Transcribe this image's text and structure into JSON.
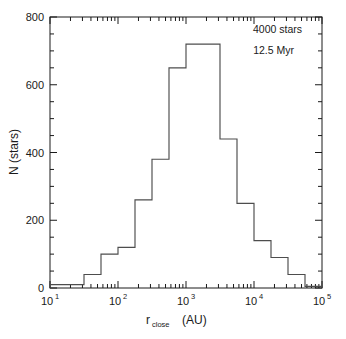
{
  "figure": {
    "background": "#ffffff",
    "line_color": "#4d4d4d",
    "axis_color": "#1a1a1a",
    "width": 346,
    "height": 339
  },
  "annotations": {
    "stars": "4000 stars",
    "age": "12.5 Myr"
  },
  "axes": {
    "y_label": "N (stars)",
    "x_label_base": "r",
    "x_label_sub": "close",
    "x_label_unit": "(AU)",
    "y_ticks": [
      {
        "value": 0,
        "label": "0"
      },
      {
        "value": 200,
        "label": "200"
      },
      {
        "value": 400,
        "label": "400"
      },
      {
        "value": 600,
        "label": "600"
      },
      {
        "value": 800,
        "label": "800"
      }
    ],
    "x_ticks": [
      {
        "value": 1,
        "mantissa": "10",
        "exponent": "1"
      },
      {
        "value": 2,
        "mantissa": "10",
        "exponent": "2"
      },
      {
        "value": 3,
        "mantissa": "10",
        "exponent": "3"
      },
      {
        "value": 4,
        "mantissa": "10",
        "exponent": "4"
      },
      {
        "value": 5,
        "mantissa": "10",
        "exponent": "5"
      }
    ]
  },
  "chart_data": {
    "type": "bar",
    "title": "",
    "xlabel": "r_close (AU)",
    "ylabel": "N (stars)",
    "xscale": "log",
    "yscale": "linear",
    "xlim": [
      10,
      100000
    ],
    "ylim": [
      0,
      800
    ],
    "grid": false,
    "legend": null,
    "annotations": [
      "4000 stars",
      "12.5 Myr"
    ],
    "bin_edges_log10": [
      1.0,
      1.25,
      1.5,
      1.75,
      2.0,
      2.25,
      2.5,
      2.75,
      3.0,
      3.25,
      3.5,
      3.75,
      4.0,
      4.25,
      4.5,
      4.75,
      5.0
    ],
    "bin_edges": [
      10,
      17.8,
      31.6,
      56.2,
      100,
      178,
      316,
      562,
      1000,
      1778,
      3162,
      5623,
      10000,
      17783,
      31623,
      56234,
      100000
    ],
    "categories": [
      "10-17.8",
      "17.8-31.6",
      "31.6-56.2",
      "56.2-100",
      "100-178",
      "178-316",
      "316-562",
      "562-1000",
      "1000-1778",
      "1778-3162",
      "3162-5623",
      "5623-10000",
      "10000-17783",
      "17783-31623",
      "31623-56234",
      "56234-100000"
    ],
    "values": [
      10,
      10,
      40,
      100,
      120,
      260,
      380,
      650,
      720,
      720,
      440,
      250,
      140,
      90,
      40,
      5
    ],
    "total": 4000
  }
}
